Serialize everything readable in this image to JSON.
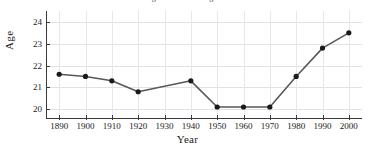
{
  "chart_data": {
    "type": "line",
    "title": "Median Age at First Marriage for Women",
    "xlabel": "Year",
    "ylabel": "Age",
    "x": [
      1890,
      1900,
      1910,
      1920,
      1940,
      1950,
      1960,
      1970,
      1980,
      1990,
      2000
    ],
    "values": [
      21.6,
      21.5,
      21.3,
      20.8,
      21.3,
      20.1,
      20.1,
      20.1,
      21.5,
      22.8,
      23.5
    ],
    "series": [
      {
        "name": "Age",
        "points": [
          {
            "x": 1890,
            "y": 21.6
          },
          {
            "x": 1900,
            "y": 21.5
          },
          {
            "x": 1910,
            "y": 21.3
          },
          {
            "x": 1920,
            "y": 20.8
          },
          {
            "x": 1940,
            "y": 21.3
          },
          {
            "x": 1950,
            "y": 20.1
          },
          {
            "x": 1960,
            "y": 20.1
          },
          {
            "x": 1970,
            "y": 20.1
          },
          {
            "x": 1980,
            "y": 21.5
          },
          {
            "x": 1990,
            "y": 22.8
          },
          {
            "x": 2000,
            "y": 23.5
          }
        ]
      }
    ],
    "xlim": [
      1885,
      2005
    ],
    "ylim": [
      19.55,
      24.5
    ],
    "xticks": [
      1890,
      1900,
      1910,
      1920,
      1930,
      1940,
      1950,
      1960,
      1970,
      1980,
      1990,
      2000
    ],
    "xtick_labels": [
      "1890",
      "1900",
      "1910",
      "1920",
      "1930",
      "1940",
      "1950",
      "1960",
      "1970",
      "1980",
      "1990",
      "2000"
    ],
    "yticks": [
      20,
      21,
      22,
      23,
      24
    ],
    "ytick_labels": [
      "20",
      "21",
      "22",
      "23",
      "24"
    ],
    "grid": true,
    "legend": false,
    "legend_position": "none",
    "line_color": "#585858",
    "marker_color": "#1a1a1a",
    "grid_color": "#e2e2e6",
    "axis_color": "#3a3a3a"
  }
}
